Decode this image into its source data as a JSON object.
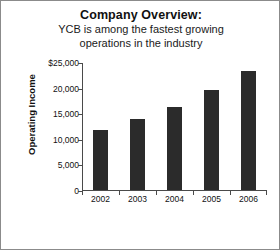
{
  "slide": {
    "title": "Company Overview:",
    "subtitle_lines": [
      "YCB is among the fastest growing",
      "operations in the industry"
    ]
  },
  "chart_data": {
    "type": "bar",
    "title": "Company Overview:",
    "subtitle": "YCB is among the fastest growing operations in the industry",
    "categories": [
      "2002",
      "2003",
      "2004",
      "2005",
      "2006"
    ],
    "values": [
      11800,
      13800,
      16300,
      19500,
      23300
    ],
    "xlabel": "",
    "ylabel": "Operating Income",
    "ylim": [
      0,
      25000
    ],
    "ytick_values": [
      0,
      5000,
      10000,
      15000,
      20000,
      25000
    ],
    "ytick_labels": [
      "0",
      "5,000",
      "10,000",
      "15,000",
      "20,000",
      "$25,000"
    ],
    "grid": false,
    "legend": false,
    "bar_color": "#2b2b2b",
    "axis_color": "#4a4a4a"
  }
}
